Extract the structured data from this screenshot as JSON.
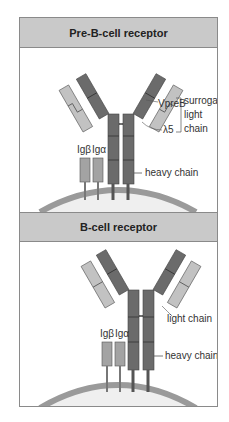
{
  "panels": [
    {
      "title": "Pre-B-cell receptor",
      "labels": {
        "vpreb": "VpreB",
        "lambda5": "λ5",
        "surrogate_light_chain_line1": "surrogate",
        "surrogate_light_chain_line2": "light",
        "surrogate_light_chain_line3": "chain",
        "ig_beta": "Igβ",
        "ig_alpha": "Igα",
        "heavy_chain": "heavy chain"
      }
    },
    {
      "title": "B-cell receptor",
      "labels": {
        "light_chain": "light chain",
        "ig_beta": "Igβ",
        "ig_alpha": "Igα",
        "heavy_chain": "heavy chain"
      }
    }
  ],
  "colors": {
    "heavy_chain": "#6b6b6b",
    "light_chain": "#c2c2c2",
    "ig_alpha_beta": "#a3a3a3",
    "membrane": "#9a9a9a",
    "cell_interior": "#efefef",
    "header_bg": "#c9c9c9"
  }
}
